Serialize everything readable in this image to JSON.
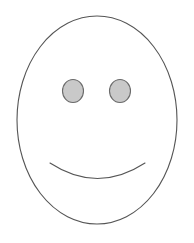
{
  "canvas": {
    "width": 194,
    "height": 243,
    "background_color": "#ffffff",
    "title": "Smiley Face"
  },
  "drawing": {
    "type": "line-drawing",
    "subject": "smiley-face",
    "stroke_color": "#555555",
    "stroke_width": 1,
    "face": {
      "shape": "ellipse",
      "label": "face outline",
      "cx": 97,
      "cy": 120,
      "rx": 80,
      "ry": 104,
      "fill": "none",
      "stroke": "#555555",
      "stroke_width": 1.1
    },
    "eyes": [
      {
        "shape": "ellipse",
        "label": "left eye",
        "cx": 73,
        "cy": 91,
        "rx": 10.5,
        "ry": 11.5,
        "fill": "#c9c9c9",
        "stroke": "#6a6a6a",
        "stroke_width": 1.1
      },
      {
        "shape": "ellipse",
        "label": "right eye",
        "cx": 120,
        "cy": 91,
        "rx": 10.5,
        "ry": 11.5,
        "fill": "#c9c9c9",
        "stroke": "#6a6a6a",
        "stroke_width": 1.1
      }
    ],
    "mouth": {
      "shape": "arc",
      "label": "smile",
      "path": "M 50 163 Q 97.5 194 145 163",
      "start": [
        50,
        163
      ],
      "end": [
        145,
        163
      ],
      "lowest_y": 179,
      "fill": "none",
      "stroke": "#555555",
      "stroke_width": 1.1
    }
  },
  "alt_text": "Simple line drawing of a smiley face: a tall oval outline with two shaded oval eyes and a curved smiling mouth."
}
